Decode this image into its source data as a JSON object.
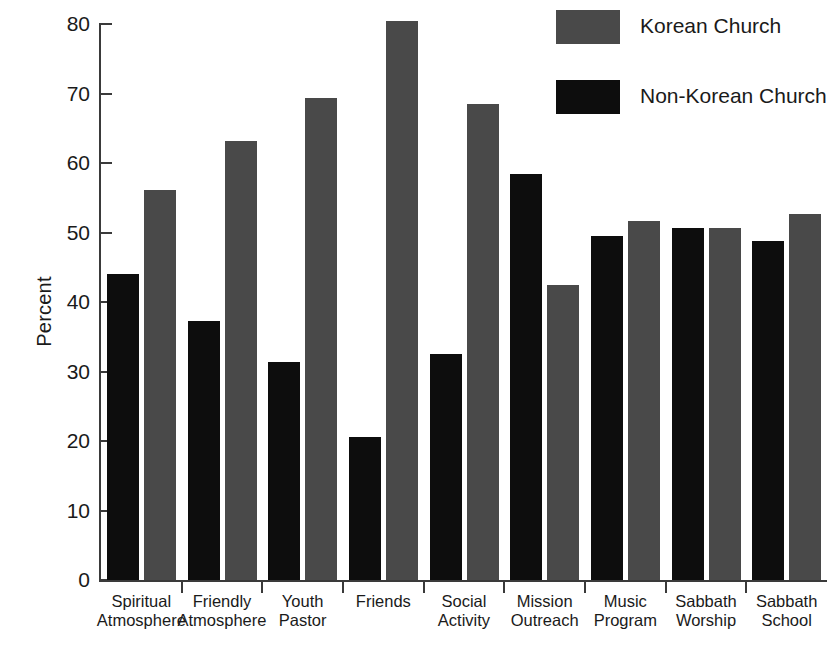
{
  "chart_data": {
    "type": "bar",
    "title": "",
    "xlabel": "",
    "ylabel": "Percent",
    "ylim": [
      0,
      80
    ],
    "ytick_values": [
      0,
      10,
      20,
      30,
      40,
      50,
      60,
      70,
      80
    ],
    "grid": false,
    "legend_position": "top-right",
    "categories": [
      "Spiritual Atmosphere",
      "Friendly Atmosphere",
      "Youth Pastor",
      "Friends",
      "Social Activity",
      "Mission Outreach",
      "Music Program",
      "Sabbath Worship",
      "Sabbath School"
    ],
    "category_lines": [
      [
        "Spiritual",
        "Atmosphere"
      ],
      [
        "Friendly",
        "Atmosphere"
      ],
      [
        "Youth",
        "Pastor"
      ],
      [
        "Friends",
        ""
      ],
      [
        "Social",
        "Activity"
      ],
      [
        "Mission",
        "Outreach"
      ],
      [
        "Music",
        "Program"
      ],
      [
        "Sabbath",
        "Worship"
      ],
      [
        "Sabbath",
        "School"
      ]
    ],
    "series": [
      {
        "name": "Non-Korean Church",
        "color": "#0d0d0d",
        "values": [
          44.1,
          37.2,
          31.4,
          20.6,
          32.5,
          58.4,
          49.5,
          50.7,
          48.8
        ]
      },
      {
        "name": "Korean Church",
        "color": "#494949",
        "values": [
          56.1,
          63.2,
          69.3,
          80.4,
          68.5,
          42.5,
          51.6,
          50.7,
          52.7
        ]
      }
    ]
  },
  "axis": {
    "y_label": "Percent",
    "y_ticks": [
      "80",
      "70",
      "60",
      "50",
      "40",
      "30",
      "20",
      "10",
      "0"
    ]
  },
  "legend": {
    "entries": [
      {
        "label": "Korean Church",
        "color": "#494949"
      },
      {
        "label": "Non-Korean Church",
        "color": "#0d0d0d"
      }
    ]
  }
}
